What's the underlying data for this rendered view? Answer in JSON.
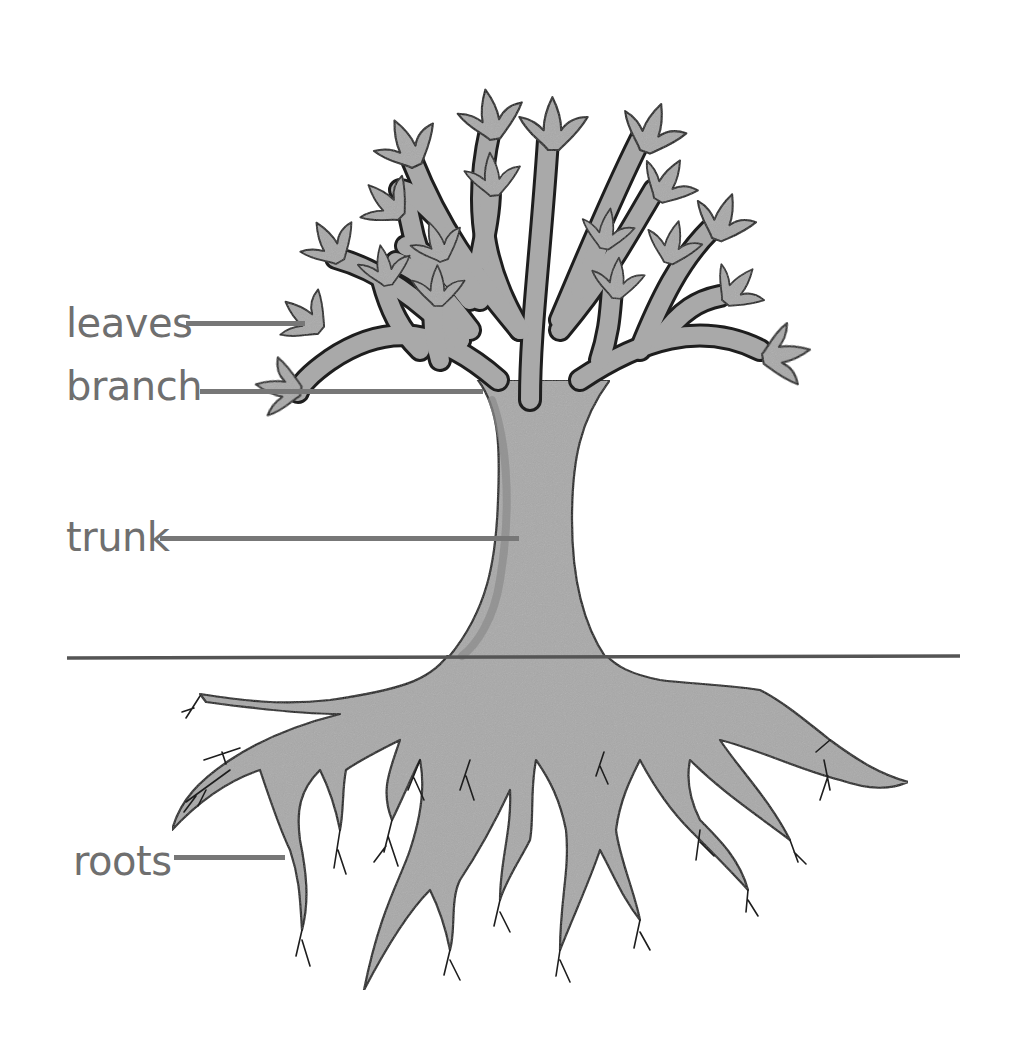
{
  "diagram": {
    "colors": {
      "background": "#ffffff",
      "fill": "#a9a9a9",
      "fill_shadow": "#8a8a8a",
      "outline": "#1e1e1e",
      "label_text": "#6f6f6f",
      "leader_line": "#777777",
      "ground_line": "#555555"
    },
    "labels": [
      {
        "id": "leaves",
        "text": "leaves",
        "text_x": 66,
        "text_y": 305,
        "line_x1": 186,
        "line_x2": 305,
        "line_y": 323
      },
      {
        "id": "branch",
        "text": "branch",
        "text_x": 66,
        "text_y": 368,
        "line_x1": 200,
        "line_x2": 483,
        "line_y": 391
      },
      {
        "id": "trunk",
        "text": "trunk",
        "text_x": 66,
        "text_y": 519,
        "line_x1": 160,
        "line_x2": 519,
        "line_y": 538
      },
      {
        "id": "roots",
        "text": "roots",
        "text_x": 73,
        "text_y": 843,
        "line_x1": 174,
        "line_x2": 285,
        "line_y": 857
      }
    ],
    "ground_line": {
      "x1": 67,
      "x2": 960,
      "y": 658
    }
  }
}
